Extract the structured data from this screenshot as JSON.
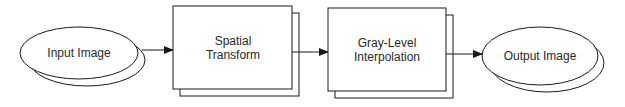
{
  "diagram": {
    "type": "flowchart",
    "colors": {
      "stroke": "#1a1a1a",
      "fill": "#ffffff",
      "text": "#2a2a2a"
    },
    "nodes": [
      {
        "id": "input",
        "shape": "ellipse-stacked",
        "label": "Input Image"
      },
      {
        "id": "spatial",
        "shape": "rect-stacked",
        "label_line1": "Spatial",
        "label_line2": "Transform"
      },
      {
        "id": "gray",
        "shape": "rect-stacked",
        "label_line1": "Gray-Level",
        "label_line2": "Interpolation"
      },
      {
        "id": "output",
        "shape": "ellipse-stacked",
        "label": "Output Image"
      }
    ],
    "edges": [
      {
        "from": "input",
        "to": "spatial"
      },
      {
        "from": "spatial",
        "to": "gray"
      },
      {
        "from": "gray",
        "to": "output"
      }
    ]
  }
}
